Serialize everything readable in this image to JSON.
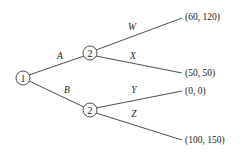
{
  "diagram": {
    "type": "game-tree",
    "nodes": [
      {
        "id": "root",
        "label": "1",
        "player": "1",
        "x": 23,
        "y": 78
      },
      {
        "id": "p2_top",
        "label": "2",
        "player": "2",
        "x": 90,
        "y": 53
      },
      {
        "id": "p2_bottom",
        "label": "2",
        "player": "2",
        "x": 90,
        "y": 110
      }
    ],
    "edges": [
      {
        "id": "A",
        "label": "A",
        "from": "root",
        "to": "p2_top"
      },
      {
        "id": "B",
        "label": "B",
        "from": "root",
        "to": "p2_bottom"
      },
      {
        "id": "W",
        "label": "W",
        "from": "p2_top",
        "to": "payoff_W"
      },
      {
        "id": "X",
        "label": "X",
        "from": "p2_top",
        "to": "payoff_X"
      },
      {
        "id": "Y",
        "label": "Y",
        "from": "p2_bottom",
        "to": "payoff_Y"
      },
      {
        "id": "Z",
        "label": "Z",
        "from": "p2_bottom",
        "to": "payoff_Z"
      }
    ],
    "payoffs": {
      "W": "(60, 120)",
      "X": "(50, 50)",
      "Y": "(0, 0)",
      "Z": "(100, 150)"
    }
  }
}
